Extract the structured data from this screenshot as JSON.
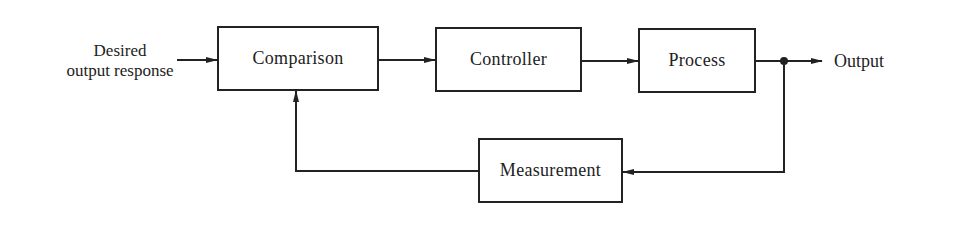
{
  "diagram": {
    "type": "closed-loop feedback control block diagram",
    "input_label_line1": "Desired",
    "input_label_line2": "output response",
    "blocks": [
      {
        "id": "comparison",
        "label": "Comparison"
      },
      {
        "id": "controller",
        "label": "Controller"
      },
      {
        "id": "process",
        "label": "Process"
      },
      {
        "id": "measurement",
        "label": "Measurement"
      }
    ],
    "output_label": "Output",
    "edges": [
      {
        "from": "input",
        "to": "comparison"
      },
      {
        "from": "comparison",
        "to": "controller"
      },
      {
        "from": "controller",
        "to": "process"
      },
      {
        "from": "process",
        "to": "output"
      },
      {
        "from": "output-junction",
        "to": "measurement"
      },
      {
        "from": "measurement",
        "to": "comparison"
      }
    ],
    "colors": {
      "line": "#222222",
      "background": "#ffffff"
    }
  }
}
